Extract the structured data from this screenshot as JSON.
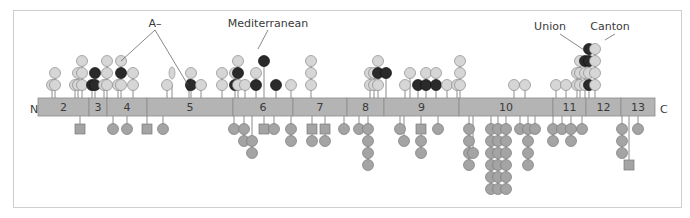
{
  "colors": {
    "bar": "#b4b4b4",
    "bar_border": "#8c8c8c",
    "light_circle": "#d6d6d6",
    "dark_circle": "#2a2a2a",
    "below_circle": "#a4a4a4",
    "stem": "#6e6e6e",
    "text": "#3a3a3a"
  },
  "terminals": {
    "n": "N",
    "c": "C"
  },
  "annotations": [
    {
      "label": "A–",
      "x": 155,
      "y": 27
    },
    {
      "label": "Mediterranean",
      "x": 268,
      "y": 27
    },
    {
      "label": "Union",
      "x": 550,
      "y": 30
    },
    {
      "label": "Canton",
      "x": 610,
      "y": 30
    }
  ],
  "exons": [
    {
      "label": "2",
      "x0": 38,
      "x1": 89
    },
    {
      "label": "3",
      "x0": 89,
      "x1": 107
    },
    {
      "label": "4",
      "x0": 107,
      "x1": 147
    },
    {
      "label": "5",
      "x0": 147,
      "x1": 233
    },
    {
      "label": "6",
      "x0": 233,
      "x1": 293
    },
    {
      "label": "7",
      "x0": 293,
      "x1": 347
    },
    {
      "label": "8",
      "x0": 347,
      "x1": 384
    },
    {
      "label": "9",
      "x0": 384,
      "x1": 459
    },
    {
      "label": "10",
      "x0": 459,
      "x1": 553
    },
    {
      "label": "11",
      "x0": 553,
      "x1": 586
    },
    {
      "label": "12",
      "x0": 586,
      "x1": 621
    },
    {
      "label": "13",
      "x0": 621,
      "x1": 655
    }
  ],
  "above_variants": [
    {
      "x": 52,
      "levels": [
        "l"
      ]
    },
    {
      "x": 55,
      "levels": [
        "l",
        "l"
      ]
    },
    {
      "x": 75,
      "levels": [
        "l"
      ]
    },
    {
      "x": 78,
      "levels": [
        "l",
        "l"
      ]
    },
    {
      "x": 82,
      "levels": [
        "l",
        "l",
        "l"
      ]
    },
    {
      "x": 92,
      "levels": [
        "d"
      ]
    },
    {
      "x": 95,
      "levels": [
        "d",
        "d"
      ]
    },
    {
      "x": 104,
      "levels": [
        "l"
      ]
    },
    {
      "x": 107,
      "levels": [
        "l",
        "l",
        "l"
      ]
    },
    {
      "x": 118,
      "levels": [
        "l"
      ]
    },
    {
      "x": 121,
      "levels": [
        "l",
        "d",
        "l"
      ]
    },
    {
      "x": 133,
      "levels": [
        "l",
        "l"
      ]
    },
    {
      "x": 167,
      "levels": [
        "l"
      ]
    },
    {
      "x": 172,
      "levels": [
        "e2"
      ]
    },
    {
      "x": 189,
      "levels": [
        "e1"
      ]
    },
    {
      "x": 191,
      "levels": [
        "d",
        "l"
      ]
    },
    {
      "x": 201,
      "levels": [
        "l"
      ]
    },
    {
      "x": 222,
      "levels": [
        "l",
        "l"
      ]
    },
    {
      "x": 235,
      "levels": [
        "d",
        "l"
      ]
    },
    {
      "x": 238,
      "levels": [
        "l",
        "d",
        "l"
      ]
    },
    {
      "x": 245,
      "levels": [
        "l"
      ]
    },
    {
      "x": 256,
      "levels": [
        "d",
        "l"
      ]
    },
    {
      "x": 264,
      "levels": [
        "s3d"
      ]
    },
    {
      "x": 276,
      "levels": [
        "d"
      ]
    },
    {
      "x": 291,
      "levels": [
        "l"
      ]
    },
    {
      "x": 311,
      "levels": [
        "l",
        "l",
        "l"
      ]
    },
    {
      "x": 370,
      "levels": [
        "l",
        "l"
      ]
    },
    {
      "x": 374,
      "levels": [
        "l",
        "l"
      ]
    },
    {
      "x": 378,
      "levels": [
        "l",
        "d",
        "l"
      ]
    },
    {
      "x": 386,
      "levels": [
        "x2d"
      ]
    },
    {
      "x": 405,
      "levels": [
        "l"
      ]
    },
    {
      "x": 410,
      "levels": [
        "x2l"
      ]
    },
    {
      "x": 418,
      "levels": [
        "d"
      ]
    },
    {
      "x": 426,
      "levels": [
        "d",
        "l"
      ]
    },
    {
      "x": 436,
      "levels": [
        "d",
        "l"
      ]
    },
    {
      "x": 447,
      "levels": [
        "l"
      ]
    },
    {
      "x": 457,
      "levels": [
        "l"
      ]
    },
    {
      "x": 460,
      "levels": [
        "l",
        "l",
        "l"
      ]
    },
    {
      "x": 514,
      "levels": [
        "l"
      ]
    },
    {
      "x": 525,
      "levels": [
        "l"
      ]
    },
    {
      "x": 556,
      "levels": [
        "l"
      ]
    },
    {
      "x": 566,
      "levels": [
        "l"
      ]
    },
    {
      "x": 577,
      "levels": [
        "l",
        "l"
      ]
    },
    {
      "x": 580,
      "levels": [
        "l",
        "l",
        "l"
      ]
    },
    {
      "x": 585,
      "levels": [
        "l",
        "l",
        "d"
      ]
    },
    {
      "x": 589,
      "levels": [
        "d",
        "l",
        "d",
        "d"
      ]
    },
    {
      "x": 595,
      "levels": [
        "l",
        "l",
        "l",
        "l"
      ]
    }
  ],
  "below_variants": [
    {
      "x": 80,
      "shapes": [
        "sq"
      ]
    },
    {
      "x": 113,
      "shapes": [
        "c"
      ]
    },
    {
      "x": 127,
      "shapes": [
        "c"
      ]
    },
    {
      "x": 147,
      "shapes": [
        "sq"
      ]
    },
    {
      "x": 163,
      "shapes": [
        "c"
      ]
    },
    {
      "x": 234,
      "shapes": [
        "c"
      ]
    },
    {
      "x": 244,
      "shapes": [
        "c",
        "c"
      ]
    },
    {
      "x": 252,
      "shapes": [
        "c2",
        "c"
      ]
    },
    {
      "x": 264,
      "shapes": [
        "sq"
      ]
    },
    {
      "x": 274,
      "shapes": [
        "c"
      ]
    },
    {
      "x": 291,
      "shapes": [
        "c",
        "c"
      ]
    },
    {
      "x": 312,
      "shapes": [
        "sq",
        "c"
      ]
    },
    {
      "x": 325,
      "shapes": [
        "sq",
        "c2"
      ]
    },
    {
      "x": 344,
      "shapes": [
        "c"
      ]
    },
    {
      "x": 359,
      "shapes": [
        "c"
      ]
    },
    {
      "x": 368,
      "shapes": [
        "c",
        "c",
        "c",
        "c"
      ]
    },
    {
      "x": 400,
      "shapes": [
        "c"
      ]
    },
    {
      "x": 404,
      "shapes": [
        "c2"
      ]
    },
    {
      "x": 421,
      "shapes": [
        "sq",
        "c",
        "c"
      ]
    },
    {
      "x": 438,
      "shapes": [
        "c"
      ]
    },
    {
      "x": 469,
      "shapes": [
        "c",
        "c",
        "c",
        "c"
      ]
    },
    {
      "x": 473,
      "shapes": [
        "c3"
      ]
    },
    {
      "x": 491,
      "shapes": [
        "c",
        "c",
        "c",
        "c",
        "c",
        "c"
      ]
    },
    {
      "x": 498,
      "shapes": [
        "c",
        "c",
        "c",
        "c",
        "c",
        "c"
      ]
    },
    {
      "x": 506,
      "shapes": [
        "c",
        "c",
        "c",
        "c",
        "c",
        "c"
      ]
    },
    {
      "x": 520,
      "shapes": [
        "c"
      ]
    },
    {
      "x": 528,
      "shapes": [
        "c",
        "c",
        "c",
        "c"
      ]
    },
    {
      "x": 535,
      "shapes": [
        "c"
      ]
    },
    {
      "x": 553,
      "shapes": [
        "c",
        "c"
      ]
    },
    {
      "x": 562,
      "shapes": [
        "c"
      ]
    },
    {
      "x": 571,
      "shapes": [
        "c",
        "c"
      ]
    },
    {
      "x": 582,
      "shapes": [
        "c"
      ]
    },
    {
      "x": 622,
      "shapes": [
        "c",
        "c",
        "c"
      ]
    },
    {
      "x": 629,
      "shapes": [
        "sq4"
      ]
    },
    {
      "x": 638,
      "shapes": [
        "c"
      ]
    }
  ]
}
